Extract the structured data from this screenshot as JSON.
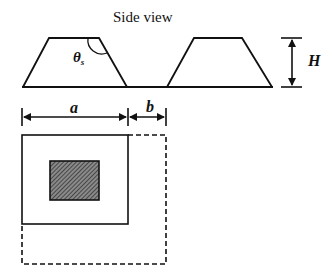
{
  "diagram": {
    "title": "Side view",
    "labels": {
      "angle": "θ",
      "angle_sub": "s",
      "height": "H",
      "width_a": "a",
      "width_b": "b"
    },
    "colors": {
      "stroke": "#111111",
      "hatch_fill": "#555555",
      "background": "#ffffff"
    },
    "side_view": {
      "trapezoids": 2,
      "description": "Two trapezoidal structures on a common baseline with side-wall angle θs and height H"
    },
    "top_view": {
      "description": "Solid square of width a containing hatched central rectangle, enclosed by dashed square extended by b"
    }
  }
}
